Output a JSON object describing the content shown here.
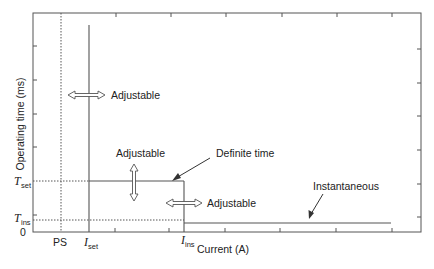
{
  "diagram": {
    "type": "time-current characteristic",
    "axes": {
      "ylabel": "Operating time (ms)",
      "xlabel": "Current (A)",
      "y_origin_label": "0"
    },
    "y_markers": [
      {
        "symbol": "T",
        "subscript": "set"
      },
      {
        "symbol": "T",
        "subscript": "ins"
      }
    ],
    "x_markers": [
      {
        "label": "PS"
      },
      {
        "symbol": "I",
        "subscript": "set"
      },
      {
        "symbol": "I",
        "subscript": "ins"
      }
    ],
    "annotations": {
      "adjustable_iset": "Adjustable",
      "adjustable_tset": "Adjustable",
      "adjustable_iins": "Adjustable",
      "definite_time": "Definite time",
      "instantaneous": "Instantaneous"
    },
    "colors": {
      "line": "#555555",
      "text": "#222222"
    }
  }
}
